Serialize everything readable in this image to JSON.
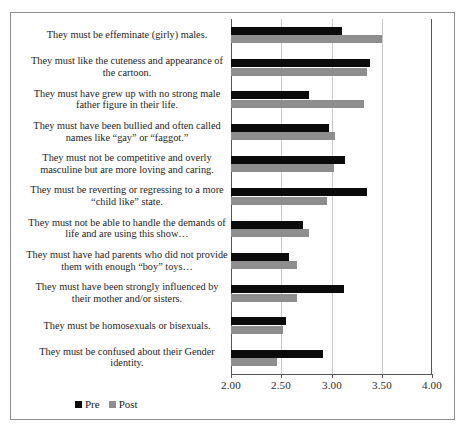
{
  "chart_data": {
    "type": "bar",
    "orientation": "horizontal",
    "title": "",
    "xlabel": "",
    "ylabel": "",
    "xlim": [
      2.0,
      4.0
    ],
    "xticks": [
      "2.00",
      "2.50",
      "3.00",
      "3.50",
      "4.00"
    ],
    "xtick_values": [
      2.0,
      2.5,
      3.0,
      3.5,
      4.0
    ],
    "grid": true,
    "legend_position": "bottom-left",
    "categories": [
      "They must be effeminate (girly) males.",
      "They must like the cuteness and appearance of the cartoon.",
      "They must have grew up with no strong male father figure in their life.",
      "They must have been bullied and often called names like “gay” or “faggot.”",
      "They must not be competitive and overly masculine but are more loving and caring.",
      "They must be reverting or regressing to a more “child like” state.",
      "They must not be able to handle the demands of life and are using this show…",
      "They must have had parents who did not provide them with enough “boy” toys…",
      "They must have been strongly influenced by their mother and/or sisters.",
      "They must be homosexuals or bisexuals.",
      "They must be confused about their Gender identity."
    ],
    "series": [
      {
        "name": "Pre",
        "color": "#0b0b0b",
        "values": [
          3.1,
          3.38,
          2.78,
          2.98,
          3.13,
          3.35,
          2.72,
          2.58,
          3.12,
          2.55,
          2.92
        ]
      },
      {
        "name": "Post",
        "color": "#8e8e8e",
        "values": [
          3.5,
          3.35,
          3.32,
          3.03,
          3.02,
          2.96,
          2.78,
          2.66,
          2.66,
          2.52,
          2.46
        ]
      }
    ]
  },
  "legend": {
    "items": [
      {
        "label": "Pre"
      },
      {
        "label": "Post"
      }
    ]
  }
}
